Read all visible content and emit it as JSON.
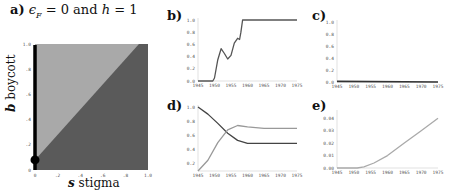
{
  "chart_data": [
    {
      "panel": "a",
      "type": "heatmap",
      "title": "a) εF = 0 and h = 1",
      "title_parts": {
        "label": "a)",
        "text": "ϵ",
        "sub": "F",
        "rest": " = 0 and ",
        "h": "h",
        "rest2": " = 1"
      },
      "xlabel": "s stigma",
      "xlabel_parts": {
        "var": "s",
        "text": "stigma"
      },
      "ylabel": "b boycott",
      "ylabel_parts": {
        "var": "b",
        "text": "boycott"
      },
      "xlim": [
        0,
        1.0
      ],
      "ylim": [
        0,
        1.0
      ],
      "xticks": [
        "0",
        ".2",
        ".4",
        ".6",
        ".8",
        "1.0"
      ],
      "yticks": [
        "0",
        ".2",
        ".4",
        ".6",
        ".8",
        "1.0"
      ],
      "regions": [
        {
          "name": "upper-left (b > s + 0.08)",
          "color": "#a9a9a9"
        },
        {
          "name": "lower-right (b < s + 0.08)",
          "color": "#5a5a5a"
        }
      ],
      "boundary": {
        "x": [
          0,
          0.92
        ],
        "y": [
          0.08,
          1.0
        ]
      },
      "highlight_line": {
        "x": 0,
        "y": [
          0,
          1.0
        ],
        "color": "#000000"
      },
      "marker": {
        "x": 0,
        "y": 0.08,
        "color": "#000000"
      }
    },
    {
      "panel": "b",
      "type": "line",
      "label": "b)",
      "xlim": [
        1945,
        1975
      ],
      "ylim": [
        0,
        1.0
      ],
      "xticks": [
        "1945",
        "1950",
        "1955",
        "1960",
        "1965",
        "1970",
        "1975"
      ],
      "yticks": [
        "0.0",
        "0.2",
        "0.4",
        "0.6",
        "0.8",
        "1.0"
      ],
      "series": [
        {
          "name": "b",
          "color": "#555555",
          "x": [
            1945,
            1949.5,
            1950,
            1951,
            1952,
            1953,
            1954,
            1955,
            1956,
            1957,
            1957.6,
            1958,
            1958.5,
            1959,
            1975
          ],
          "y": [
            0,
            0,
            0.05,
            0.35,
            0.53,
            0.45,
            0.36,
            0.42,
            0.62,
            0.7,
            0.68,
            0.8,
            1.0,
            1.0,
            1.0
          ]
        }
      ]
    },
    {
      "panel": "c",
      "type": "line",
      "label": "c)",
      "xlim": [
        1945,
        1975
      ],
      "ylim": [
        0,
        1.0
      ],
      "xticks": [
        "1945",
        "1950",
        "1955",
        "1960",
        "1965",
        "1970",
        "1975"
      ],
      "yticks": [
        "0.0",
        "0.2",
        "0.4",
        "0.6",
        "0.8",
        "1.0"
      ],
      "series": [
        {
          "name": "c",
          "color": "#333333",
          "x": [
            1945,
            1975
          ],
          "y": [
            0.01,
            0.0
          ]
        }
      ]
    },
    {
      "panel": "d",
      "type": "line",
      "label": "d)",
      "xlim": [
        1945,
        1975
      ],
      "ylim": [
        0.1,
        1.0
      ],
      "xticks": [
        "1945",
        "1950",
        "1955",
        "1960",
        "1965",
        "1970",
        "1975"
      ],
      "yticks": [
        "0.2",
        "0.4",
        "0.6",
        "0.8",
        "1.0"
      ],
      "series": [
        {
          "name": "dark",
          "color": "#444444",
          "x": [
            1945,
            1948,
            1951,
            1954,
            1957,
            1960,
            1965,
            1970,
            1975
          ],
          "y": [
            1.0,
            0.9,
            0.77,
            0.63,
            0.53,
            0.49,
            0.49,
            0.49,
            0.49
          ]
        },
        {
          "name": "light",
          "color": "#999999",
          "x": [
            1945,
            1948,
            1951,
            1954,
            1957,
            1960,
            1965,
            1970,
            1975
          ],
          "y": [
            0.1,
            0.25,
            0.5,
            0.68,
            0.74,
            0.72,
            0.7,
            0.7,
            0.7
          ]
        }
      ]
    },
    {
      "panel": "e",
      "type": "line",
      "label": "e)",
      "xlim": [
        1945,
        1975
      ],
      "ylim": [
        0,
        0.045
      ],
      "xticks": [
        "1945",
        "1950",
        "1955",
        "1960",
        "1965",
        "1970",
        "1975"
      ],
      "yticks": [
        "0.00",
        "0.01",
        "0.02",
        "0.03",
        "0.04"
      ],
      "series": [
        {
          "name": "e",
          "color": "#aaaaaa",
          "x": [
            1945,
            1951,
            1953,
            1956,
            1960,
            1965,
            1970,
            1975
          ],
          "y": [
            0.0,
            0.0,
            0.001,
            0.004,
            0.01,
            0.02,
            0.03,
            0.04
          ]
        }
      ]
    }
  ]
}
